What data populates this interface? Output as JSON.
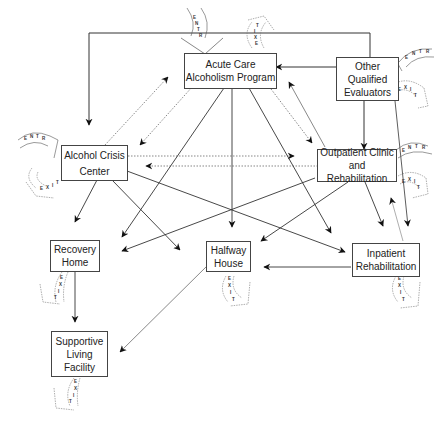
{
  "diagram": {
    "nodes": {
      "acute": {
        "line1": "Acute Care",
        "line2": "Alcoholism Program"
      },
      "other": {
        "line1": "Other",
        "line2": "Qualified",
        "line3": "Evaluators"
      },
      "crisis": {
        "line1": "Alcohol Crisis",
        "line2": "Center"
      },
      "outpatient": {
        "line1": "Outpatient Clinic",
        "line2": "and Rehabilitation"
      },
      "recovery": {
        "line1": "Recovery",
        "line2": "Home"
      },
      "halfway": {
        "line1": "Halfway",
        "line2": "House"
      },
      "inpatient": {
        "line1": "Inpatient",
        "line2": "Rehabilitation"
      },
      "supportive": {
        "line1": "Supportive",
        "line2": "Living",
        "line3": "Facility"
      }
    },
    "badges": {
      "entry": "E N T R Y",
      "exit": "E X I T"
    },
    "edges": [
      {
        "from": "Other Qualified Evaluators",
        "to": "Alcohol Crisis Center",
        "style": "solid"
      },
      {
        "from": "Other Qualified Evaluators",
        "to": "Acute Care Alcoholism Program",
        "style": "solid"
      },
      {
        "from": "Other Qualified Evaluators",
        "to": "Outpatient Clinic and Rehabilitation",
        "style": "solid"
      },
      {
        "from": "Alcohol Crisis Center",
        "to": "Acute Care Alcoholism Program",
        "style": "dotted"
      },
      {
        "from": "Acute Care Alcoholism Program",
        "to": "Alcohol Crisis Center",
        "style": "dotted"
      },
      {
        "from": "Alcohol Crisis Center",
        "to": "Outpatient Clinic and Rehabilitation",
        "style": "dotted"
      },
      {
        "from": "Outpatient Clinic and Rehabilitation",
        "to": "Alcohol Crisis Center",
        "style": "dotted"
      },
      {
        "from": "Acute Care Alcoholism Program",
        "to": "Outpatient Clinic and Rehabilitation",
        "style": "dotted"
      },
      {
        "from": "Outpatient Clinic and Rehabilitation",
        "to": "Acute Care Alcoholism Program",
        "style": "dotted"
      },
      {
        "from": "Acute Care Alcoholism Program",
        "to": "Recovery Home",
        "style": "solid"
      },
      {
        "from": "Acute Care Alcoholism Program",
        "to": "Halfway House",
        "style": "solid"
      },
      {
        "from": "Acute Care Alcoholism Program",
        "to": "Inpatient Rehabilitation",
        "style": "solid"
      },
      {
        "from": "Alcohol Crisis Center",
        "to": "Recovery Home",
        "style": "solid"
      },
      {
        "from": "Alcohol Crisis Center",
        "to": "Halfway House",
        "style": "solid"
      },
      {
        "from": "Alcohol Crisis Center",
        "to": "Inpatient Rehabilitation",
        "style": "solid"
      },
      {
        "from": "Outpatient Clinic and Rehabilitation",
        "to": "Recovery Home",
        "style": "solid"
      },
      {
        "from": "Outpatient Clinic and Rehabilitation",
        "to": "Halfway House",
        "style": "solid"
      },
      {
        "from": "Outpatient Clinic and Rehabilitation",
        "to": "Inpatient Rehabilitation",
        "style": "solid"
      },
      {
        "from": "Inpatient Rehabilitation",
        "to": "Outpatient Clinic and Rehabilitation",
        "style": "thin"
      },
      {
        "from": "Inpatient Rehabilitation",
        "to": "Halfway House",
        "style": "solid"
      },
      {
        "from": "Recovery Home",
        "to": "Supportive Living Facility",
        "style": "solid"
      },
      {
        "from": "Halfway House",
        "to": "Supportive Living Facility",
        "style": "thin"
      }
    ]
  }
}
